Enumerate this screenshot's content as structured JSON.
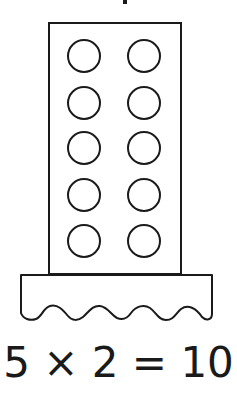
{
  "figure": {
    "rows": 5,
    "columns": 2,
    "circle_count": 10,
    "stroke_color": "#1a1a1a",
    "fill_color": "#ffffff"
  },
  "equation": {
    "text": "5 × 2 = 10",
    "factor_a": 5,
    "factor_b": 2,
    "product": 10
  }
}
